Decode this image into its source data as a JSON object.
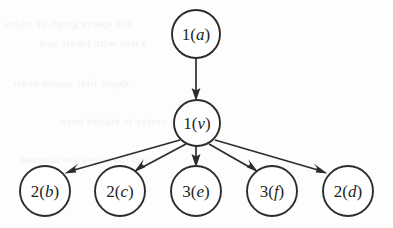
{
  "figure": {
    "kind": "directed-graph",
    "title": "",
    "ink_color": "#2c2c2c",
    "background_color": "#fdfdfd",
    "bleed_text_color": "#f1f1f1",
    "bleed_lines": [
      "the sparse graph of nodes",
      "a tree with labels and",
      "depth first search order",
      "each vertex is visited once",
      "and the edges are scanned"
    ]
  },
  "nodes": [
    {
      "id": "a",
      "number": "1",
      "paren_open": "(",
      "variable": "a",
      "paren_close": ")",
      "cx": 196,
      "cy": 34,
      "r": 24,
      "level": 0
    },
    {
      "id": "v",
      "number": "1",
      "paren_open": "(",
      "variable": "v",
      "paren_close": ")",
      "cx": 197,
      "cy": 123,
      "r": 23,
      "level": 1
    },
    {
      "id": "b",
      "number": "2",
      "paren_open": "(",
      "variable": "b",
      "paren_close": ")",
      "cx": 45,
      "cy": 191,
      "r": 25,
      "level": 2
    },
    {
      "id": "c",
      "number": "2",
      "paren_open": "(",
      "variable": "c",
      "paren_close": ")",
      "cx": 120,
      "cy": 191,
      "r": 25,
      "level": 2
    },
    {
      "id": "e",
      "number": "3",
      "paren_open": "(",
      "variable": "e",
      "paren_close": ")",
      "cx": 196,
      "cy": 191,
      "r": 25,
      "level": 2
    },
    {
      "id": "f",
      "number": "3",
      "paren_open": "(",
      "variable": "f",
      "paren_close": ")",
      "cx": 272,
      "cy": 191,
      "r": 25,
      "level": 2
    },
    {
      "id": "d",
      "number": "2",
      "paren_open": "(",
      "variable": "d",
      "paren_close": ")",
      "cx": 348,
      "cy": 191,
      "r": 25,
      "level": 2
    }
  ],
  "edges": [
    {
      "from": "a",
      "to": "v",
      "x1": 196,
      "y1": 58,
      "x2": 196,
      "y2": 100
    },
    {
      "from": "v",
      "to": "b",
      "x1": 180,
      "y1": 140,
      "x2": 66,
      "y2": 173
    },
    {
      "from": "v",
      "to": "c",
      "x1": 186,
      "y1": 144,
      "x2": 136,
      "y2": 172
    },
    {
      "from": "v",
      "to": "e",
      "x1": 196,
      "y1": 146,
      "x2": 196,
      "y2": 166
    },
    {
      "from": "v",
      "to": "f",
      "x1": 209,
      "y1": 144,
      "x2": 256,
      "y2": 172
    },
    {
      "from": "v",
      "to": "d",
      "x1": 215,
      "y1": 140,
      "x2": 327,
      "y2": 173
    }
  ]
}
